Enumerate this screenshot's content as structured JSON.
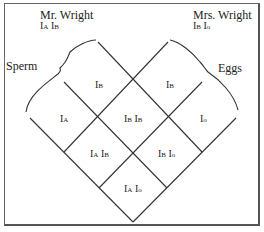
{
  "father": {
    "name": "Mr. Wright",
    "genotype": [
      "I",
      "A",
      "I",
      "B"
    ]
  },
  "mother": {
    "name": "Mrs. Wright",
    "genotype": [
      "I",
      "B",
      "I",
      "o"
    ]
  },
  "labels": {
    "sperm": "Sperm",
    "eggs": "Eggs"
  },
  "sperm_alleles": [
    {
      "base": "I",
      "sup": "B"
    },
    {
      "base": "I",
      "sup": "A"
    }
  ],
  "egg_alleles": [
    {
      "base": "I",
      "sup": "B"
    },
    {
      "base": "I",
      "sup": "o"
    }
  ],
  "offspring": [
    {
      "a": "I",
      "as": "B",
      "b": "I",
      "bs": "B"
    },
    {
      "a": "I",
      "as": "A",
      "b": "I",
      "bs": "B"
    },
    {
      "a": "I",
      "as": "B",
      "b": "I",
      "bs": "o"
    },
    {
      "a": "I",
      "as": "A",
      "b": "I",
      "bs": "o"
    }
  ],
  "colors": {
    "line": "#333333",
    "text": "#222222",
    "border": "#555555"
  }
}
